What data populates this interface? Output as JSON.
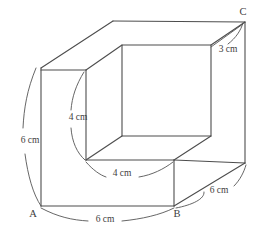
{
  "figure": {
    "stroke_color": "#4d4d4d",
    "leader_color": "#555555",
    "text_color": "#3d3d3d",
    "background": "#ffffff",
    "vertices": [
      {
        "name": "A",
        "label": "A",
        "x": 33,
        "y": 215
      },
      {
        "name": "B",
        "label": "B",
        "x": 177,
        "y": 215
      },
      {
        "name": "C",
        "label": "C",
        "x": 243,
        "y": 13
      }
    ],
    "dimensions": [
      {
        "name": "left-height",
        "label": "6 cm",
        "value": 6,
        "unit": "cm",
        "x": 30,
        "y": 141
      },
      {
        "name": "bottom-front-width",
        "label": "6 cm",
        "value": 6,
        "unit": "cm",
        "x": 105,
        "y": 219
      },
      {
        "name": "bottom-right-depth",
        "label": "6 cm",
        "value": 6,
        "unit": "cm",
        "x": 219,
        "y": 191
      },
      {
        "name": "notch-height",
        "label": "4 cm",
        "value": 4,
        "unit": "cm",
        "x": 78,
        "y": 118
      },
      {
        "name": "notch-depth",
        "label": "4 cm",
        "value": 4,
        "unit": "cm",
        "x": 122,
        "y": 173
      },
      {
        "name": "top-back-offset",
        "label": "3 cm",
        "value": 3,
        "unit": "cm",
        "x": 227,
        "y": 50
      }
    ]
  }
}
